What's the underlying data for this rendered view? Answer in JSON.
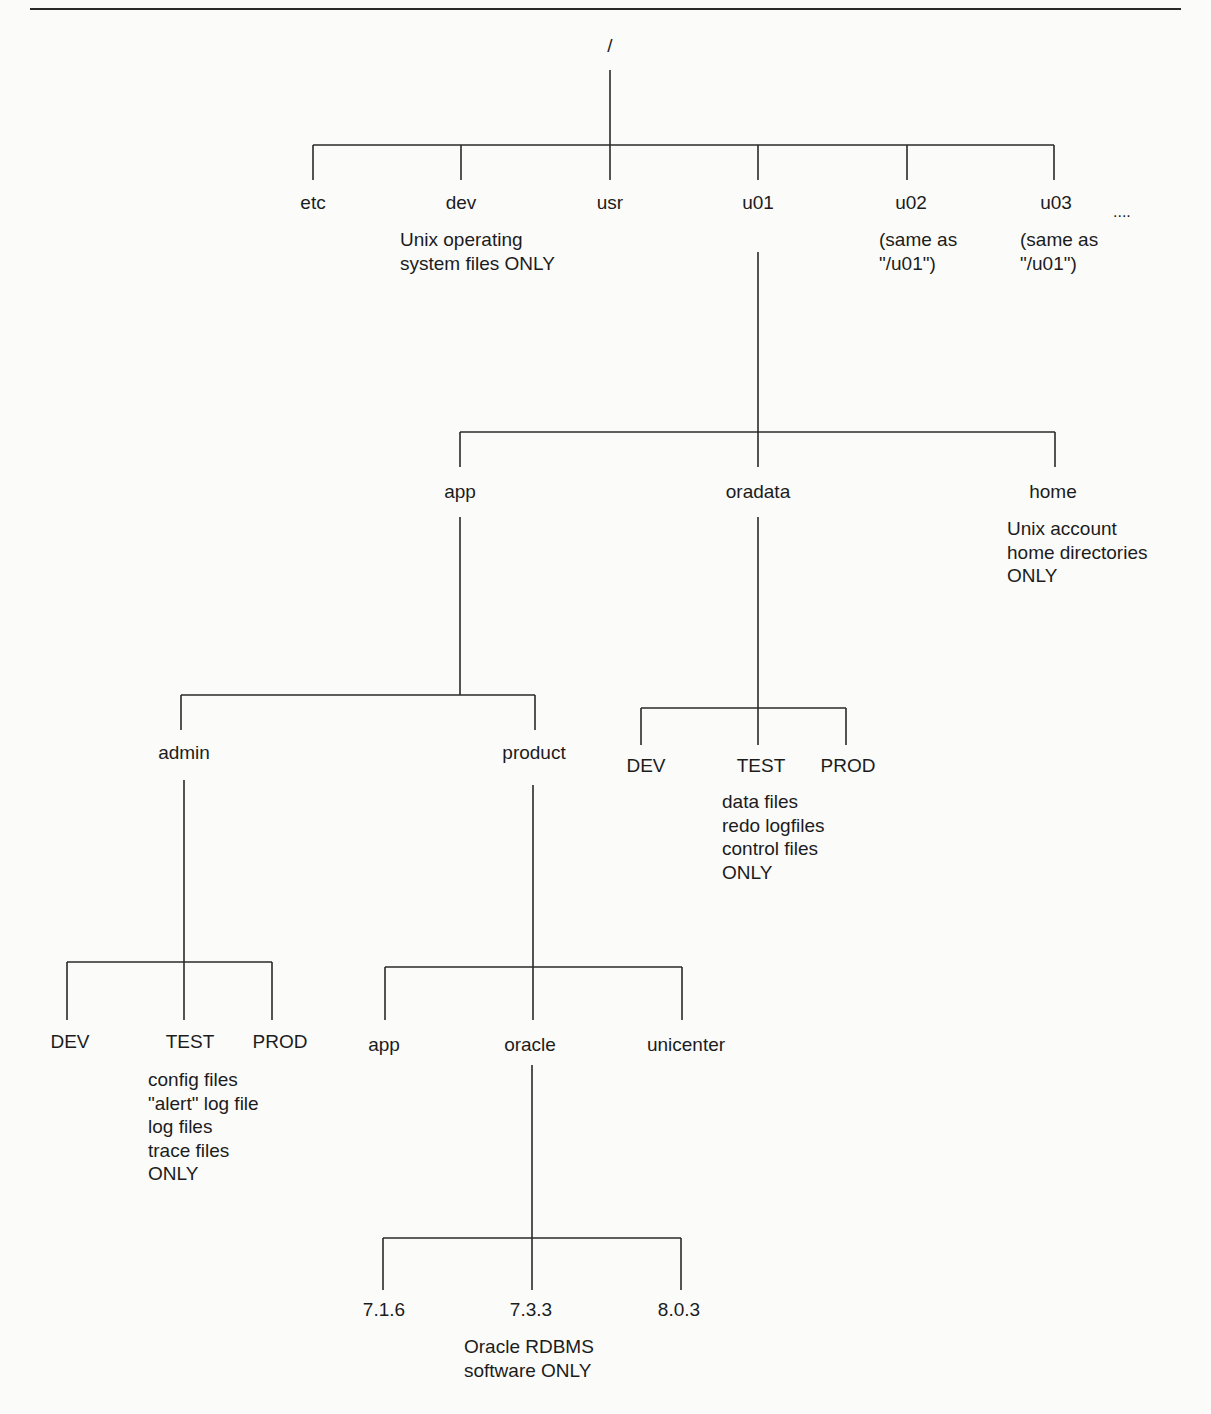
{
  "diagram": {
    "root": "/",
    "level1": {
      "etc": "etc",
      "dev": "dev",
      "usr": "usr",
      "u01": "u01",
      "u02": "u02",
      "u03": "u03",
      "ellipsis": "...."
    },
    "notes": {
      "dev": [
        "Unix operating",
        "system files ONLY"
      ],
      "u02": [
        "(same as",
        "\"/u01\")"
      ],
      "u03": [
        "(same as",
        "\"/u01\")"
      ],
      "home": [
        "Unix account",
        "home directories",
        "ONLY"
      ],
      "oradata_test": [
        "data files",
        "redo logfiles",
        "control files",
        "ONLY"
      ],
      "admin_test": [
        "config files",
        "\"alert\" log file",
        "log files",
        "trace files",
        "ONLY"
      ],
      "oracle_733": [
        "Oracle RDBMS",
        "software ONLY"
      ]
    },
    "u01_children": {
      "app": "app",
      "oradata": "oradata",
      "home": "home"
    },
    "app_children": {
      "admin": "admin",
      "product": "product"
    },
    "oradata_children": {
      "dev": "DEV",
      "test": "TEST",
      "prod": "PROD"
    },
    "admin_children": {
      "dev": "DEV",
      "test": "TEST",
      "prod": "PROD"
    },
    "product_children": {
      "app": "app",
      "oracle": "oracle",
      "unicenter": "unicenter"
    },
    "oracle_children": {
      "v716": "7.1.6",
      "v733": "7.3.3",
      "v803": "8.0.3"
    }
  }
}
